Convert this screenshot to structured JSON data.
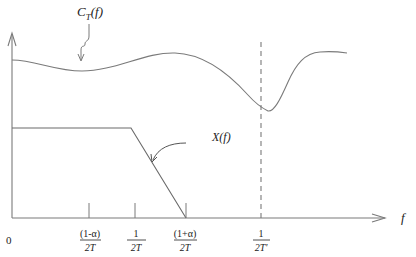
{
  "figure": {
    "colors": {
      "line": "#7a7a7a",
      "text": "#222222",
      "background": "#ffffff"
    },
    "axes": {
      "x_label": "f",
      "origin_label": "0"
    },
    "curves": {
      "channel": {
        "label_main": "C",
        "label_sub": "T",
        "label_suffix": "(f)"
      },
      "spectrum": {
        "label": "X(f)"
      }
    },
    "ticks": [
      {
        "numerator": "(1-α)",
        "denominator": "2T"
      },
      {
        "numerator": "1",
        "denominator": "2T"
      },
      {
        "numerator": "(1+α)",
        "denominator": "2T"
      },
      {
        "numerator": "1",
        "denominator": "2T'"
      }
    ]
  }
}
